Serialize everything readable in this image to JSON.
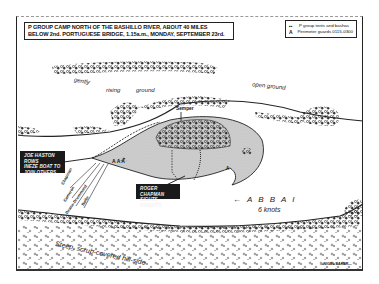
{
  "title": {
    "line1": "P GROUP CAMP NORTH OF THE BASHILLO RIVER,  ABOUT 40 MILES",
    "line2": "BELOW 2nd. PORTUGUESE  BRIDGE,  1.15a.m., MONDAY,  SEPTEMBER 23rd."
  },
  "legend": {
    "items": [
      {
        "symbol": "▪▪",
        "icon": "tent-icon",
        "label": "P group tents and bashas"
      },
      {
        "symbol": "A",
        "icon": "guard-icon",
        "label": "Perimeter guards 0115-0300"
      }
    ]
  },
  "terrain_labels": {
    "gently": "gently",
    "rising": "rising",
    "ground": "ground",
    "open_ground": "open ground",
    "hillside": "Steep, scrub-covered hill-side"
  },
  "place_labels": {
    "semper": "Semper"
  },
  "river": {
    "name": "A B B A I",
    "arrow": "←",
    "speed": "6 knots"
  },
  "people": [
    "Chapman",
    "Cameron",
    "Deane-Drummond",
    "Bailie"
  ],
  "callouts": {
    "haston": {
      "line1": "JOE HASTON ROWS",
      "line2": "INEZE BOAT TO",
      "line3": "JOIN OTHERS"
    },
    "chapman": {
      "line1": "ROGER CHAPMAN",
      "line2": "SIGHTS BANDITS"
    }
  },
  "credit": "—NIGEL BAKER—",
  "colors": {
    "ink": "#1a1a1a",
    "camp_fill": "#cfcfcf",
    "paper": "#ffffff"
  }
}
